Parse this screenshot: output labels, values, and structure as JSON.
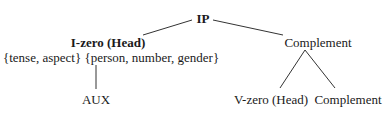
{
  "diagram": {
    "type": "syntax-tree",
    "root": {
      "label": "IP",
      "children": [
        {
          "label": "I-zero (Head)",
          "features": "{tense, aspect} {person, number, gender}",
          "children": [
            {
              "label": "AUX"
            }
          ]
        },
        {
          "label": "Complement",
          "children": [
            {
              "label": "V-zero (Head)"
            },
            {
              "label": "Complement"
            }
          ]
        }
      ]
    },
    "nodes": {
      "ip": "IP",
      "i_zero": "I-zero (Head)",
      "i_zero_features": "{tense, aspect} {person, number, gender}",
      "aux": "AUX",
      "complement": "Complement",
      "v_zero": "V-zero (Head)",
      "complement_inner": "Complement"
    },
    "colors": {
      "text": "#1a1a1a",
      "edge": "#333333",
      "background": "#ffffff"
    }
  }
}
